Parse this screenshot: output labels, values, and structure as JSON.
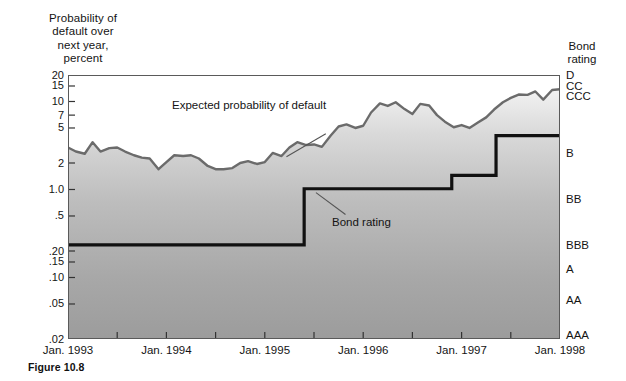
{
  "figure": {
    "caption": "Figure 10.8"
  },
  "axis": {
    "y_title_lines": [
      "Probability of",
      "default over",
      "next year,",
      "percent"
    ],
    "right_title_lines": [
      "Bond",
      "rating"
    ]
  },
  "chart_data": {
    "type": "line",
    "title": "",
    "xlabel": "",
    "ylabel": "Probability of default over next year, percent",
    "yscale": "log",
    "ylim": [
      0.02,
      20
    ],
    "grid": false,
    "legend": "none",
    "annotations": [
      {
        "text": "Expected probability of default",
        "target_series": "expected_probability_of_default"
      },
      {
        "text": "Bond rating",
        "target_series": "bond_rating"
      }
    ],
    "x_tick_labels": [
      "Jan. 1993",
      "Jan. 1994",
      "Jan. 1995",
      "Jan. 1996",
      "Jan. 1997",
      "Jan. 1998"
    ],
    "x_tick_values": [
      1993.0,
      1994.0,
      1995.0,
      1996.0,
      1997.0,
      1998.0
    ],
    "x_minor_tick_values": [
      1993.5,
      1994.5,
      1995.5,
      1996.5,
      1997.5
    ],
    "y_tick_labels": [
      "20",
      "15",
      "10",
      "7",
      "5",
      "2",
      "1.0",
      ".5",
      ".20",
      ".15",
      ".10",
      ".05",
      ".02"
    ],
    "y_tick_values": [
      20,
      15,
      10,
      7,
      5,
      2,
      1.0,
      0.5,
      0.2,
      0.15,
      0.1,
      0.05,
      0.02
    ],
    "right_axis_labels": [
      "D",
      "CC",
      "CCC",
      "B",
      "BB",
      "BBB",
      "A",
      "AA",
      "AAA"
    ],
    "right_axis_values": [
      20,
      15,
      11.5,
      2.6,
      0.78,
      0.235,
      0.125,
      0.056,
      0.022
    ],
    "series": [
      {
        "name": "expected_probability_of_default",
        "label": "Expected probability of default",
        "color": "#6b6b6b",
        "width": 2.4,
        "fill_below": true,
        "x": [
          1993.0,
          1993.08,
          1993.17,
          1993.25,
          1993.33,
          1993.42,
          1993.5,
          1993.58,
          1993.67,
          1993.75,
          1993.83,
          1993.92,
          1994.0,
          1994.08,
          1994.17,
          1994.25,
          1994.33,
          1994.42,
          1994.5,
          1994.58,
          1994.67,
          1994.75,
          1994.83,
          1994.92,
          1995.0,
          1995.08,
          1995.17,
          1995.25,
          1995.33,
          1995.42,
          1995.5,
          1995.58,
          1995.67,
          1995.75,
          1995.83,
          1995.92,
          1996.0,
          1996.08,
          1996.17,
          1996.25,
          1996.33,
          1996.42,
          1996.5,
          1996.58,
          1996.67,
          1996.75,
          1996.83,
          1996.92,
          1997.0,
          1997.08,
          1997.17,
          1997.25,
          1997.33,
          1997.42,
          1997.5,
          1997.58,
          1997.67,
          1997.75,
          1997.83,
          1997.92,
          1998.0
        ],
        "y": [
          3.0,
          2.7,
          2.55,
          3.45,
          2.7,
          2.95,
          3.0,
          2.7,
          2.45,
          2.3,
          2.25,
          1.7,
          2.05,
          2.45,
          2.4,
          2.45,
          2.25,
          1.85,
          1.7,
          1.7,
          1.75,
          2.0,
          2.1,
          1.95,
          2.05,
          2.6,
          2.4,
          3.0,
          3.45,
          3.2,
          3.25,
          3.05,
          4.1,
          5.2,
          5.5,
          5.0,
          5.3,
          7.5,
          9.5,
          8.9,
          9.8,
          8.2,
          7.2,
          9.4,
          9.0,
          7.0,
          5.9,
          5.1,
          5.4,
          5.0,
          5.8,
          6.6,
          8.1,
          9.8,
          11.0,
          12.0,
          11.9,
          13.0,
          10.5,
          13.5,
          13.8
        ]
      },
      {
        "name": "bond_rating",
        "label": "Bond rating",
        "color": "#111111",
        "width": 3.2,
        "step": true,
        "x": [
          1993.0,
          1995.4,
          1995.4,
          1996.9,
          1996.9,
          1997.35,
          1997.35,
          1998.0
        ],
        "y": [
          0.235,
          0.235,
          1.02,
          1.02,
          1.45,
          1.45,
          4.1,
          4.1
        ],
        "rating_steps": [
          {
            "from": "Jan. 1993",
            "to": "mid 1995",
            "rating": "BBB",
            "probability": 0.235
          },
          {
            "from": "mid 1995",
            "to": "late 1996",
            "rating": "BB",
            "probability": 1.02
          },
          {
            "from": "late 1996",
            "to": "mid 1997",
            "rating": "BB",
            "probability": 1.45
          },
          {
            "from": "mid 1997",
            "to": "Jan. 1998",
            "rating": "B",
            "probability": 4.1
          }
        ]
      }
    ]
  },
  "colors": {
    "curve": "#6b6b6b",
    "step": "#111111",
    "fill_top": "#f3f3f3",
    "fill_bottom": "#9e9e9e",
    "frame": "#5a5a5a",
    "text": "#141414"
  }
}
